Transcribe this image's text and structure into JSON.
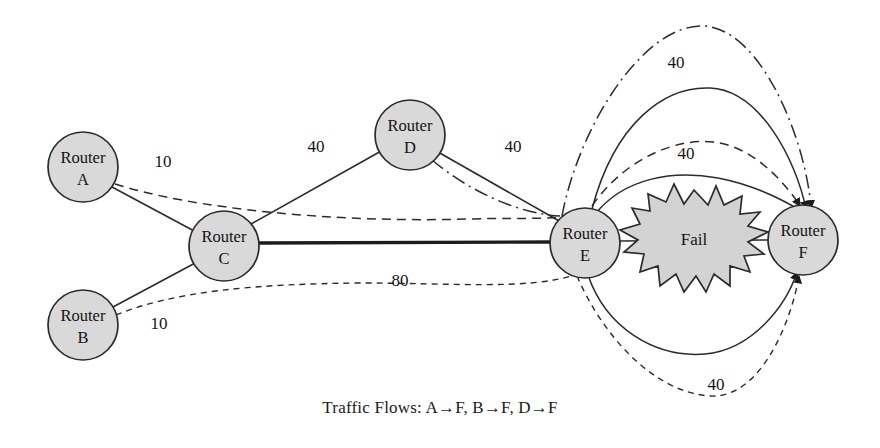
{
  "figure": {
    "type": "network-topology-diagram",
    "caption": "Traffic Flows: A→F, B→F, D→F",
    "background_color": "#ffffff",
    "node_fill": "#d9d9d9",
    "node_stroke": "#2b2b2b",
    "fail_fill": "#d3d3d3"
  },
  "nodes": [
    {
      "id": "A",
      "label_line1": "Router",
      "label_line2": "A",
      "cx": 83,
      "cy": 167,
      "r": 35
    },
    {
      "id": "B",
      "label_line1": "Router",
      "label_line2": "B",
      "cx": 83,
      "cy": 325,
      "r": 35
    },
    {
      "id": "C",
      "label_line1": "Router",
      "label_line2": "C",
      "cx": 224,
      "cy": 246,
      "r": 35
    },
    {
      "id": "D",
      "label_line1": "Router",
      "label_line2": "D",
      "cx": 410,
      "cy": 135,
      "r": 35
    },
    {
      "id": "E",
      "label_line1": "Router",
      "label_line2": "E",
      "cx": 585,
      "cy": 243,
      "r": 35
    },
    {
      "id": "F",
      "label_line1": "Router",
      "label_line2": "F",
      "cx": 803,
      "cy": 240,
      "r": 35
    }
  ],
  "fail_marker": {
    "label": "Fail",
    "cx": 694,
    "cy": 240
  },
  "links": [
    {
      "from": "A",
      "to": "C",
      "style": "solid-thin",
      "cost": null
    },
    {
      "from": "B",
      "to": "C",
      "style": "solid-thin",
      "cost": null
    },
    {
      "from": "C",
      "to": "D",
      "style": "solid-thin",
      "cost": "40",
      "label_x": 316,
      "label_y": 148
    },
    {
      "from": "D",
      "to": "E",
      "style": "solid-thin",
      "cost": "40",
      "label_x": 513,
      "label_y": 148
    },
    {
      "from": "C",
      "to": "E",
      "style": "solid-thick",
      "cost": "80",
      "label_x": 400,
      "label_y": 282
    },
    {
      "from": "E",
      "to": "F",
      "style": "solid-thin",
      "cost": null
    }
  ],
  "flow_labels": [
    {
      "text": "10",
      "x": 163,
      "y": 163,
      "flow": "A-to-F"
    },
    {
      "text": "10",
      "x": 159,
      "y": 325,
      "flow": "B-to-F"
    },
    {
      "text": "40",
      "x": 676,
      "y": 64,
      "flow": "D-to-F-reroute-top"
    },
    {
      "text": "40",
      "x": 686,
      "y": 155,
      "flow": "A-to-F-reroute"
    },
    {
      "text": "40",
      "x": 716,
      "y": 386,
      "flow": "B-to-F-reroute-bottom"
    }
  ],
  "flows": [
    {
      "id": "A-to-F",
      "source": "A",
      "dest": "F",
      "style": "dashed",
      "value": "10"
    },
    {
      "id": "B-to-F",
      "source": "B",
      "dest": "F",
      "style": "fine-dashed",
      "value": "10"
    },
    {
      "id": "D-to-F",
      "source": "D",
      "dest": "F",
      "style": "dash-dot",
      "value": "40"
    }
  ],
  "reroute_arcs": [
    {
      "id": "arc-dashdot-top",
      "style": "dash-dot",
      "value": "40"
    },
    {
      "id": "arc-solid-upper",
      "style": "solid",
      "value": "40"
    },
    {
      "id": "arc-dashed-mid",
      "style": "dashed",
      "value": "40"
    },
    {
      "id": "arc-solid-lower",
      "style": "solid",
      "value": null
    },
    {
      "id": "arc-solid-bottom",
      "style": "solid",
      "value": null
    },
    {
      "id": "arc-dashed-bottom",
      "style": "fine-dashed",
      "value": "40"
    }
  ]
}
